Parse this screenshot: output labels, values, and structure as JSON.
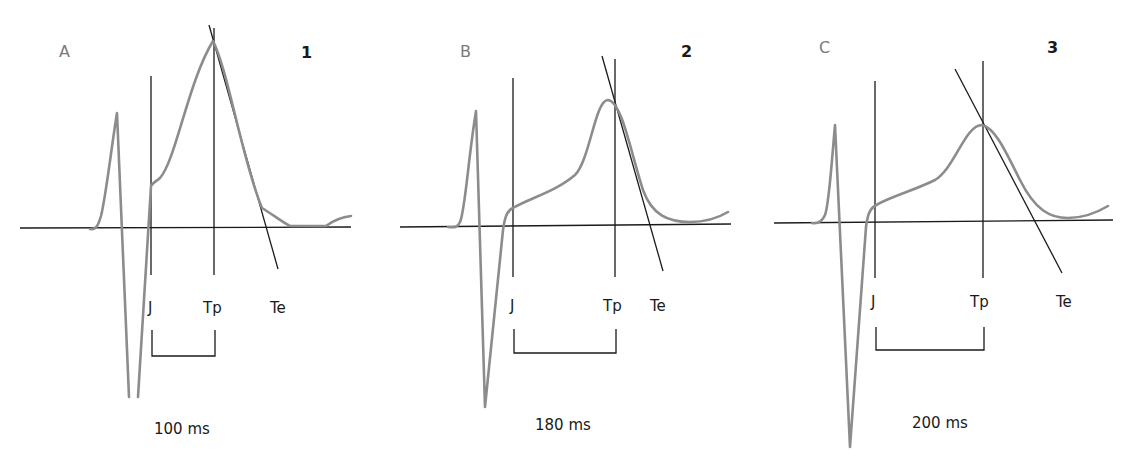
{
  "figure": {
    "colors": {
      "waveform": "#8c8c8c",
      "lines": "#1a1a1a",
      "panel_letter": "#7a7a7a"
    }
  },
  "panels": [
    {
      "letter": "A",
      "number": "1",
      "markers": {
        "j": "J",
        "tp": "Tp",
        "te": "Te"
      },
      "duration": "100 ms"
    },
    {
      "letter": "B",
      "number": "2",
      "markers": {
        "j": "J",
        "tp": "Tp",
        "te": "Te"
      },
      "duration": "180 ms"
    },
    {
      "letter": "C",
      "number": "3",
      "markers": {
        "j": "J",
        "tp": "Tp",
        "te": "Te"
      },
      "duration": "200 ms"
    }
  ]
}
